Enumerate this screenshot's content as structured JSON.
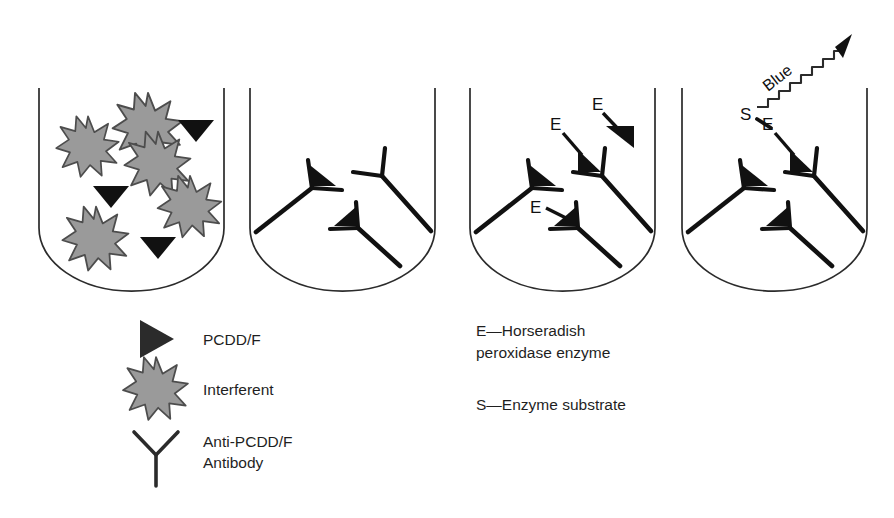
{
  "figure": {
    "panel_count": 4
  },
  "colors": {
    "ink": "#1a1a1a",
    "tube_outline": "#2b2b2b",
    "analyte_fill": "#111111",
    "interferent_fill": "#9a9a9a",
    "interferent_stroke": "#4d4d4d",
    "antibody_stroke": "#111111",
    "background": "#ffffff"
  },
  "panels": [
    {
      "id": "panel-1-sample",
      "name": "sample-with-analyte-and-interferents",
      "interferent_count": 5,
      "analyte_count": 3,
      "antibody_count": 0,
      "labels": []
    },
    {
      "id": "panel-2-binding",
      "name": "analyte-bound-to-antibody",
      "interferent_count": 0,
      "analyte_count": 2,
      "antibody_count": 3,
      "labels": []
    },
    {
      "id": "panel-3-enzyme",
      "name": "enzyme-conjugate-added",
      "antibody_count": 3,
      "labels": [
        "E",
        "E",
        "E"
      ]
    },
    {
      "id": "panel-4-signal",
      "name": "substrate-added-color-develops",
      "antibody_count": 3,
      "labels": [
        "S",
        "E",
        "Blue"
      ]
    }
  ],
  "markers": {
    "enzyme": "E",
    "substrate": "S",
    "signal": "Blue"
  },
  "legend_left": {
    "items": [
      {
        "icon": "analyte-triangle-icon",
        "label": "PCDD/F"
      },
      {
        "icon": "interferent-starburst-icon",
        "label": "Interferent"
      },
      {
        "icon": "antibody-y-icon",
        "label_line1": "Anti-PCDD/F",
        "label_line2": "Antibody"
      }
    ]
  },
  "legend_right": {
    "items": [
      {
        "key": "E",
        "line1": "E—Horseradish",
        "line2": "peroxidase enzyme"
      },
      {
        "key": "S",
        "line1": "S—Enzyme substrate",
        "line2": ""
      }
    ]
  }
}
